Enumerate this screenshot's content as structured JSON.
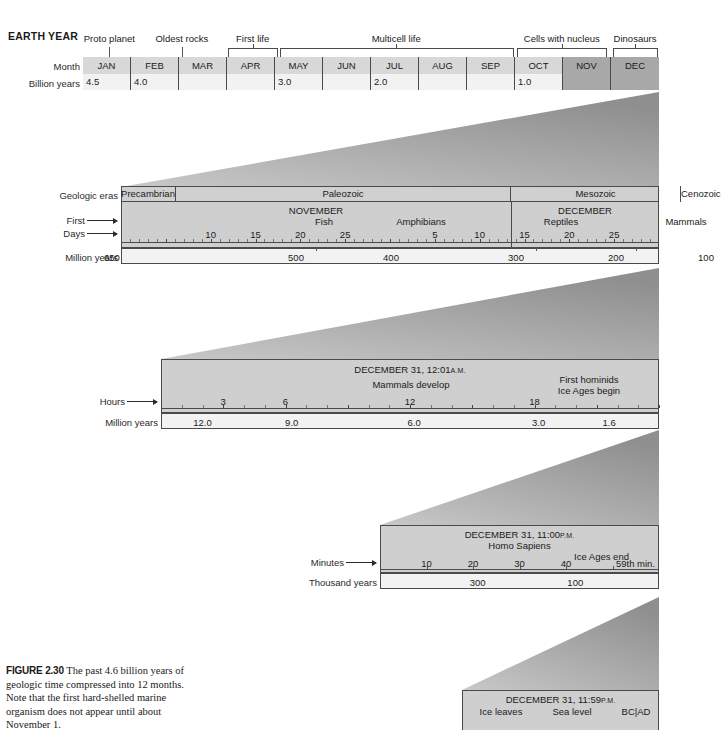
{
  "figure": {
    "header": "EARTH YEAR",
    "caption_label": "FIGURE 2.30",
    "caption_text": "The past 4.6 billion years of geologic time compressed into 12 months. Note that the first hard-shelled marine organism does not appear until about November 1."
  },
  "colors": {
    "band_fill": "#cfcfcf",
    "band_fill_light": "#e8e8e8",
    "cell_light": "#f2f2f2",
    "cell_dark": "#a8a8a8",
    "border": "#4a4a4a",
    "wedge_dark": "#9a9a9a",
    "text": "#1a1a1a"
  },
  "chart_data": {
    "type": "table",
    "bands": [
      {
        "id": "band-1-year",
        "row_labels": [
          "Month",
          "Billion years"
        ],
        "annotations": [
          {
            "label": "Proto planet",
            "marker": "tick"
          },
          {
            "label": "Oldest rocks",
            "marker": "tick"
          },
          {
            "label": "First life",
            "marker": "bracket"
          },
          {
            "label": "Multicell life",
            "marker": "bracket"
          },
          {
            "label": "Cells with nucleus",
            "marker": "bracket"
          },
          {
            "label": "Dinosaurs",
            "marker": "bracket"
          }
        ],
        "months": [
          "JAN",
          "FEB",
          "MAR",
          "APR",
          "MAY",
          "JUN",
          "JUL",
          "AUG",
          "SEP",
          "OCT",
          "NOV",
          "DEC"
        ],
        "months_shaded": [
          "NOV",
          "DEC"
        ],
        "billion_years": [
          "4.5",
          "4.0",
          "",
          "",
          "3.0",
          "",
          "2.0",
          "",
          "",
          "1.0",
          "",
          ""
        ]
      },
      {
        "id": "band-2-nov-dec",
        "row_labels": [
          "Geologic eras",
          "First",
          "Days",
          "Million years"
        ],
        "eras": [
          "Precambrian",
          "Paleozoic",
          "Mesozoic",
          "Cenozoic"
        ],
        "month_titles": [
          "NOVEMBER",
          "DECEMBER"
        ],
        "events": [
          "Fish",
          "Amphibians",
          "Reptiles",
          "Mammals"
        ],
        "day_ticks": [
          "10",
          "15",
          "20",
          "25",
          "5",
          "10",
          "15",
          "20",
          "25"
        ],
        "million_years": [
          "650",
          "500",
          "400",
          "300",
          "200",
          "100"
        ]
      },
      {
        "id": "band-3-dec31-1201am",
        "title": "DECEMBER 31, 12:01",
        "title_suffix": "A.M.",
        "row_labels": [
          "Hours",
          "Million years"
        ],
        "events": [
          "Mammals develop",
          "First hominids",
          "Ice Ages begin"
        ],
        "hour_ticks": [
          "3",
          "6",
          "12",
          "18"
        ],
        "million_years": [
          "12.0",
          "9.0",
          "6.0",
          "3.0",
          "1.6"
        ]
      },
      {
        "id": "band-4-dec31-1100pm",
        "title": "DECEMBER 31, 11:00",
        "title_suffix": "P.M.",
        "row_labels": [
          "Minutes",
          "Thousand years"
        ],
        "events": [
          "Homo Sapiens",
          "Ice Ages end",
          "59th min."
        ],
        "minute_ticks": [
          "10",
          "20",
          "30",
          "40"
        ],
        "thousand_years": [
          "300",
          "100"
        ]
      },
      {
        "id": "band-5-dec31-1159pm",
        "title": "DECEMBER 31, 11:59",
        "title_suffix": "P.M.",
        "events": [
          "Ice leaves",
          "Sea level",
          "BC|AD"
        ]
      }
    ]
  }
}
